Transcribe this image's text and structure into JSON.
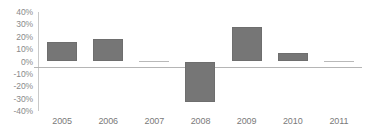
{
  "chart_data": {
    "type": "bar",
    "title": "",
    "subtitle": "",
    "xlabel": "",
    "ylabel": "",
    "categories": [
      "2005",
      "2006",
      "2007",
      "2008",
      "2009",
      "2010",
      "2011"
    ],
    "values": [
      16,
      18,
      0,
      -33,
      28,
      7,
      0
    ],
    "value_format": "percent",
    "ylim": [
      -40,
      40
    ],
    "ytick_values": [
      40,
      30,
      20,
      10,
      0,
      -10,
      -20,
      -30,
      -40
    ],
    "ytick_labels": [
      "40%",
      "30%",
      "20%",
      "10%",
      "0%",
      "-10%",
      "-20%",
      "-30%",
      "-40%"
    ],
    "grid": false,
    "legend": false,
    "legend_position": "none",
    "series": [
      {
        "name": "Series 1",
        "values": [
          16,
          18,
          0,
          -33,
          28,
          7,
          0
        ],
        "color": "#767676"
      }
    ],
    "colors": {
      "bar": "#767676",
      "bar_border": "#6e6e6e",
      "axis_line": "#c9c9c9",
      "baseline": "#b5b5b5",
      "tick_label": "#8a8a8a",
      "category_label": "#7a7a7a",
      "background": "#ffffff"
    }
  }
}
